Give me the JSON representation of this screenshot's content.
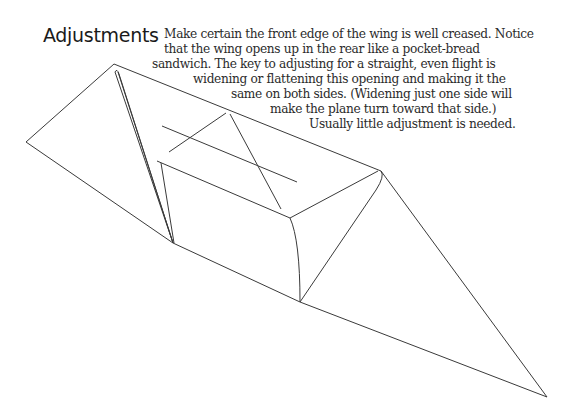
{
  "heading": "Adjustments",
  "paragraph": {
    "lines": [
      {
        "text": "Make certain the front edge of the wing is well creased. Notice",
        "x": 164,
        "y": 27
      },
      {
        "text": "that the wing opens up in the rear like a pocket-bread",
        "x": 164,
        "y": 42
      },
      {
        "text": "sandwich. The key to adjusting for a straight, even flight is",
        "x": 152,
        "y": 57
      },
      {
        "text": "widening or flattening this opening and making it the",
        "x": 193,
        "y": 72
      },
      {
        "text": "same on both sides. (Widening just one side will",
        "x": 231,
        "y": 87
      },
      {
        "text": "make the plane turn toward that side.)",
        "x": 270,
        "y": 102
      },
      {
        "text": "Usually little adjustment is needed.",
        "x": 309,
        "y": 117
      }
    ]
  },
  "illustration": {
    "subject": "paper airplane wing fold diagram",
    "stroke_color": "#3a3a3a"
  }
}
